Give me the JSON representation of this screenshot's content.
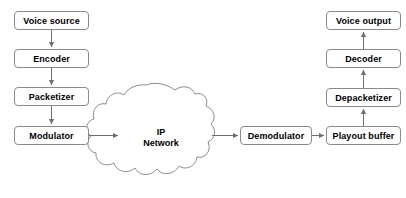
{
  "diagram": {
    "background_color": "#ffffff",
    "stroke_color": "#8a8a8a",
    "arrow_color": "#707070",
    "text_color": "#000000",
    "nodes": [
      {
        "id": "voice-source",
        "label": "Voice source",
        "x": 14,
        "y": 11,
        "w": 75,
        "h": 19
      },
      {
        "id": "encoder",
        "label": "Encoder",
        "x": 14,
        "y": 49,
        "w": 75,
        "h": 19
      },
      {
        "id": "packetizer",
        "label": "Packetizer",
        "x": 14,
        "y": 87,
        "w": 75,
        "h": 19
      },
      {
        "id": "modulator",
        "label": "Modulator",
        "x": 14,
        "y": 126,
        "w": 75,
        "h": 19
      },
      {
        "id": "demodulator",
        "label": "Demodulator",
        "x": 240,
        "y": 126,
        "w": 72,
        "h": 19
      },
      {
        "id": "playout-buffer",
        "label": "Playout buffer",
        "x": 326,
        "y": 126,
        "w": 75,
        "h": 19
      },
      {
        "id": "depacketizer",
        "label": "Depacketizer",
        "x": 326,
        "y": 88,
        "w": 75,
        "h": 19
      },
      {
        "id": "decoder",
        "label": "Decoder",
        "x": 326,
        "y": 49,
        "w": 75,
        "h": 19
      },
      {
        "id": "voice-output",
        "label": "Voice output",
        "x": 326,
        "y": 11,
        "w": 75,
        "h": 19
      }
    ],
    "cloud": {
      "id": "ip-network",
      "label_line1": "IP",
      "label_line2": "Network",
      "label_x": 128,
      "label_y": 127,
      "label_w": 66
    },
    "edges": [
      {
        "id": "voice-source-to-encoder",
        "from": "voice-source",
        "to": "encoder",
        "direction": "down"
      },
      {
        "id": "encoder-to-packetizer",
        "from": "encoder",
        "to": "packetizer",
        "direction": "down"
      },
      {
        "id": "packetizer-to-modulator",
        "from": "packetizer",
        "to": "modulator",
        "direction": "down"
      },
      {
        "id": "modulator-to-ip-network",
        "from": "modulator",
        "to": "ip-network",
        "direction": "right"
      },
      {
        "id": "ip-network-to-demodulator",
        "from": "ip-network",
        "to": "demodulator",
        "direction": "right"
      },
      {
        "id": "demodulator-to-playout-buffer",
        "from": "demodulator",
        "to": "playout-buffer",
        "direction": "right"
      },
      {
        "id": "playout-buffer-to-depacketizer",
        "from": "playout-buffer",
        "to": "depacketizer",
        "direction": "up"
      },
      {
        "id": "depacketizer-to-decoder",
        "from": "depacketizer",
        "to": "decoder",
        "direction": "up"
      },
      {
        "id": "decoder-to-voice-output",
        "from": "decoder",
        "to": "voice-output",
        "direction": "up"
      }
    ]
  }
}
